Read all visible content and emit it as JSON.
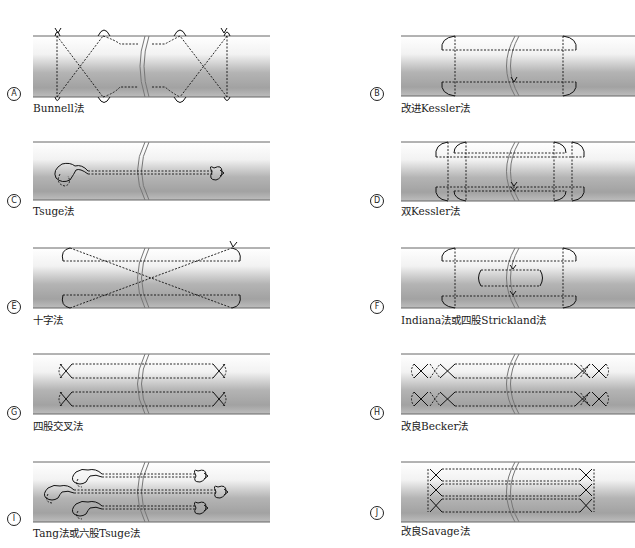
{
  "figure": {
    "top_cut_text": "",
    "panels": [
      {
        "id": "A",
        "badge": "A",
        "label": "Bunnell法",
        "technique": "bunnell"
      },
      {
        "id": "B",
        "badge": "B",
        "label": "改进Kessler法",
        "technique": "modified-kessler"
      },
      {
        "id": "C",
        "badge": "C",
        "label": "Tsuge法",
        "technique": "tsuge"
      },
      {
        "id": "D",
        "badge": "D",
        "label": "双Kessler法",
        "technique": "double-kessler"
      },
      {
        "id": "E",
        "badge": "E",
        "label": "十字法",
        "technique": "cruciate"
      },
      {
        "id": "F",
        "badge": "F",
        "label": "Indiana法或四股Strickland法",
        "technique": "indiana-strickland"
      },
      {
        "id": "G",
        "badge": "G",
        "label": "四股交叉法",
        "technique": "four-strand-cross"
      },
      {
        "id": "H",
        "badge": "H",
        "label": "改良Becker法",
        "technique": "modified-becker"
      },
      {
        "id": "I",
        "badge": "I",
        "label": "Tang法或六股Tsuge法",
        "technique": "tang-six-strand-tsuge"
      },
      {
        "id": "J",
        "badge": "J",
        "label": "改良Savage法",
        "technique": "modified-savage"
      }
    ],
    "colors": {
      "tendon_edge": "#555555",
      "tendon_light": "#ffffff",
      "tendon_dark": "#9a9a9a",
      "suture": "#111111"
    }
  }
}
